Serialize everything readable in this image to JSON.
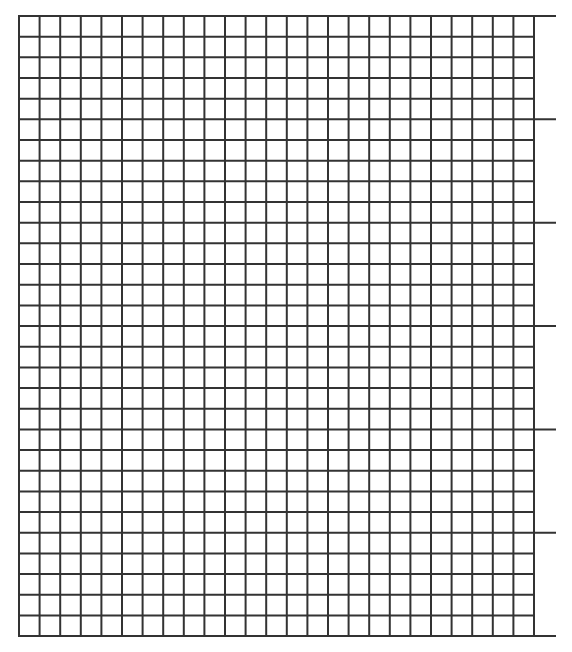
{
  "page": {
    "type": "graph-paper",
    "background": "#ffffff"
  },
  "grid": {
    "columns": 25,
    "rows": 30,
    "left": 19,
    "top": 16,
    "cell_width": 20.6,
    "cell_height": 20.67,
    "line_color": "#333333",
    "line_width": 2,
    "major_row_interval": 5,
    "major_line_extension_right": 556
  }
}
